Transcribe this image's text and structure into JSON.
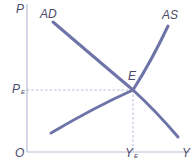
{
  "diagram": {
    "type": "aggregate-demand-aggregate-supply",
    "colors": {
      "axis": "#b9bdd6",
      "curve": "#6e74a8",
      "guide": "#b9bdd6",
      "text": "#4a4a6a"
    },
    "axes": {
      "y_label": "P",
      "x_label": "Y",
      "origin_label": "O"
    },
    "curves": [
      {
        "name": "AD",
        "label": "AD",
        "shape": "downward-sloping"
      },
      {
        "name": "AS",
        "label": "AS",
        "shape": "upward-sloping"
      }
    ],
    "equilibrium": {
      "label": "E",
      "price_label_main": "P",
      "price_label_sub": "E",
      "output_label_main": "Y",
      "output_label_sub": "E"
    }
  }
}
